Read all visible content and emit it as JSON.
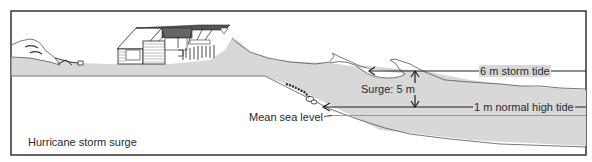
{
  "diagram": {
    "title": "Hurricane storm surge",
    "labels": {
      "storm_tide": "6 m storm tide",
      "normal_high_tide": "1 m normal high tide",
      "surge": "Surge: 5 m",
      "mean_sea_level": "Mean sea level"
    },
    "colors": {
      "land_fill": "#d8d8d8",
      "water_fill": "#d8d8d8",
      "line": "#1e1e1e",
      "frame": "#333333",
      "background": "#ffffff"
    },
    "elements": [
      "frame",
      "coastal-land",
      "beach-house",
      "dune",
      "storm-surge-water",
      "storm-tide-line",
      "normal-high-tide-line",
      "mean-sea-level-line",
      "surge-arrow",
      "debris-rocks"
    ]
  }
}
